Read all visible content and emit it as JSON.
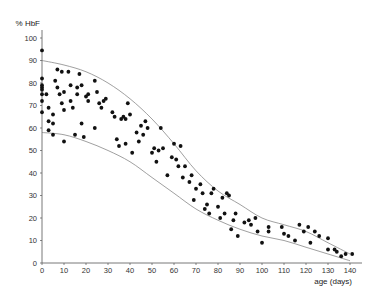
{
  "chart_data": {
    "type": "scatter",
    "title": "",
    "xlabel": "age (days)",
    "ylabel": "% HbF",
    "xlim": [
      0,
      140
    ],
    "ylim": [
      0,
      100
    ],
    "x_ticks": [
      0,
      10,
      20,
      30,
      40,
      50,
      60,
      70,
      80,
      90,
      100,
      110,
      120,
      130,
      140
    ],
    "y_ticks": [
      0,
      10,
      20,
      30,
      40,
      50,
      60,
      70,
      80,
      90,
      100
    ],
    "grid": false,
    "legend": null,
    "points": [
      [
        0,
        94.5
      ],
      [
        0,
        82
      ],
      [
        0,
        79
      ],
      [
        0,
        78
      ],
      [
        0,
        77
      ],
      [
        0,
        75
      ],
      [
        0,
        72
      ],
      [
        0,
        67
      ],
      [
        2,
        75
      ],
      [
        3,
        69
      ],
      [
        3,
        63
      ],
      [
        3,
        59
      ],
      [
        5,
        62
      ],
      [
        5,
        66
      ],
      [
        5,
        57
      ],
      [
        6,
        81
      ],
      [
        7,
        86
      ],
      [
        7,
        78
      ],
      [
        8,
        75
      ],
      [
        9,
        85
      ],
      [
        9,
        71
      ],
      [
        10,
        68
      ],
      [
        10,
        76
      ],
      [
        10,
        54
      ],
      [
        12,
        85
      ],
      [
        13,
        79
      ],
      [
        13,
        72
      ],
      [
        14,
        69
      ],
      [
        15,
        57
      ],
      [
        16,
        75
      ],
      [
        16,
        78
      ],
      [
        17,
        84
      ],
      [
        18,
        79
      ],
      [
        18,
        62
      ],
      [
        19,
        56
      ],
      [
        20,
        74
      ],
      [
        21,
        75
      ],
      [
        21,
        72
      ],
      [
        24,
        81
      ],
      [
        24,
        60
      ],
      [
        25,
        76
      ],
      [
        26,
        71
      ],
      [
        27,
        69
      ],
      [
        28,
        72
      ],
      [
        29,
        73
      ],
      [
        32,
        67
      ],
      [
        33,
        65
      ],
      [
        34,
        55
      ],
      [
        35,
        52
      ],
      [
        36,
        64
      ],
      [
        37,
        65
      ],
      [
        38,
        64
      ],
      [
        38,
        53
      ],
      [
        39,
        71
      ],
      [
        40,
        66
      ],
      [
        41,
        49
      ],
      [
        43,
        58
      ],
      [
        44,
        54
      ],
      [
        45,
        61
      ],
      [
        46,
        57
      ],
      [
        47,
        63
      ],
      [
        48,
        60
      ],
      [
        50,
        49
      ],
      [
        51,
        51
      ],
      [
        52,
        45
      ],
      [
        53,
        50
      ],
      [
        54,
        60
      ],
      [
        55,
        51
      ],
      [
        57,
        39
      ],
      [
        59,
        47
      ],
      [
        60,
        53
      ],
      [
        61,
        46
      ],
      [
        62,
        43
      ],
      [
        63,
        52
      ],
      [
        64,
        38
      ],
      [
        65,
        43
      ],
      [
        67,
        36
      ],
      [
        68,
        39
      ],
      [
        69,
        28
      ],
      [
        70,
        33
      ],
      [
        72,
        35
      ],
      [
        73,
        31
      ],
      [
        74,
        24
      ],
      [
        75,
        26
      ],
      [
        76,
        22
      ],
      [
        77,
        31
      ],
      [
        78,
        33
      ],
      [
        80,
        25
      ],
      [
        81,
        20
      ],
      [
        82,
        29
      ],
      [
        83,
        22
      ],
      [
        84,
        31
      ],
      [
        85,
        30
      ],
      [
        86,
        15
      ],
      [
        87,
        19
      ],
      [
        88,
        22
      ],
      [
        89,
        12
      ],
      [
        92,
        18
      ],
      [
        94,
        19
      ],
      [
        95,
        17
      ],
      [
        97,
        20
      ],
      [
        98,
        14
      ],
      [
        100,
        9
      ],
      [
        103,
        16
      ],
      [
        103,
        14
      ],
      [
        109,
        16
      ],
      [
        110,
        13
      ],
      [
        112,
        12
      ],
      [
        115,
        10
      ],
      [
        117,
        17
      ],
      [
        119,
        14
      ],
      [
        121,
        16
      ],
      [
        122,
        9
      ],
      [
        124,
        14
      ],
      [
        126,
        12
      ],
      [
        130,
        11
      ],
      [
        130,
        6
      ],
      [
        133,
        6
      ],
      [
        134,
        5
      ],
      [
        136,
        3
      ],
      [
        138,
        4
      ],
      [
        141,
        4
      ]
    ],
    "upper_envelope": [
      [
        0,
        90
      ],
      [
        10,
        88
      ],
      [
        20,
        85
      ],
      [
        30,
        80
      ],
      [
        40,
        73
      ],
      [
        50,
        64
      ],
      [
        60,
        53
      ],
      [
        70,
        41
      ],
      [
        80,
        32
      ],
      [
        90,
        26
      ],
      [
        100,
        20
      ],
      [
        110,
        17
      ],
      [
        120,
        14
      ],
      [
        130,
        9
      ],
      [
        140,
        4
      ]
    ],
    "lower_envelope": [
      [
        0,
        58
      ],
      [
        10,
        57
      ],
      [
        20,
        54
      ],
      [
        30,
        50
      ],
      [
        40,
        45
      ],
      [
        50,
        38
      ],
      [
        60,
        31
      ],
      [
        70,
        24
      ],
      [
        80,
        19
      ],
      [
        90,
        15
      ],
      [
        100,
        12
      ],
      [
        110,
        10
      ],
      [
        120,
        7
      ],
      [
        130,
        4
      ],
      [
        140,
        1
      ]
    ]
  }
}
